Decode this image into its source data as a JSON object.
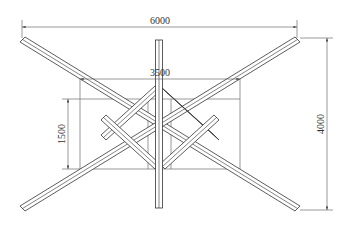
{
  "drawing": {
    "dimensions": {
      "overall_width": "6000",
      "inner_width": "3500",
      "inner_height": "1500",
      "overall_height": "4000"
    },
    "colors": {
      "line": "#333333",
      "background": "#ffffff"
    }
  }
}
